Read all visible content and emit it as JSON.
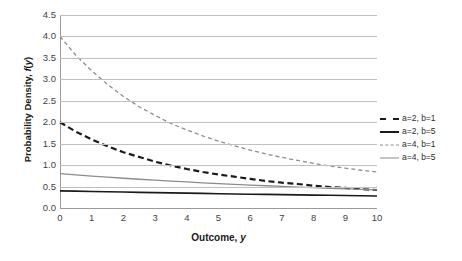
{
  "chart_data": {
    "type": "line",
    "title": "",
    "xlabel": "Outcome, y",
    "ylabel": "Probability Density, f(y)",
    "xlim": [
      0,
      10
    ],
    "ylim": [
      0,
      4.5
    ],
    "grid": true,
    "legend_position": "right",
    "x_ticks": [
      "0",
      "1",
      "2",
      "3",
      "4",
      "5",
      "6",
      "7",
      "8",
      "9",
      "10"
    ],
    "y_ticks": [
      "0.0",
      "0.5",
      "1.0",
      "1.5",
      "2.0",
      "2.5",
      "3.0",
      "3.5",
      "4.0",
      "4.5"
    ],
    "x": [
      0,
      0.5,
      1,
      1.5,
      2,
      2.5,
      3,
      3.5,
      4,
      4.5,
      5,
      5.5,
      6,
      6.5,
      7,
      7.5,
      8,
      8.5,
      9,
      9.5,
      10
    ],
    "series": [
      {
        "name": "a=2, b=1",
        "color": "#1a1a1a",
        "style": "dashed",
        "width": 2.2,
        "values": [
          2.0,
          1.78,
          1.6,
          1.44,
          1.3,
          1.19,
          1.08,
          0.99,
          0.91,
          0.84,
          0.78,
          0.73,
          0.68,
          0.63,
          0.59,
          0.56,
          0.52,
          0.49,
          0.47,
          0.44,
          0.42
        ]
      },
      {
        "name": "a=2, b=5",
        "color": "#1a1a1a",
        "style": "solid",
        "width": 1.6,
        "values": [
          0.4,
          0.393,
          0.386,
          0.379,
          0.372,
          0.365,
          0.359,
          0.352,
          0.346,
          0.34,
          0.334,
          0.328,
          0.322,
          0.317,
          0.311,
          0.306,
          0.301,
          0.296,
          0.291,
          0.286,
          0.281
        ]
      },
      {
        "name": "a=4, b=1",
        "color": "#8c8c8c",
        "style": "dashed",
        "width": 1.3,
        "values": [
          4.0,
          3.56,
          3.2,
          2.88,
          2.6,
          2.36,
          2.16,
          1.97,
          1.82,
          1.68,
          1.56,
          1.45,
          1.35,
          1.26,
          1.18,
          1.11,
          1.04,
          0.98,
          0.93,
          0.88,
          0.84
        ]
      },
      {
        "name": "a=4, b=5",
        "color": "#8c8c8c",
        "style": "solid",
        "width": 1.3,
        "values": [
          0.8,
          0.771,
          0.744,
          0.718,
          0.694,
          0.67,
          0.648,
          0.627,
          0.607,
          0.588,
          0.569,
          0.552,
          0.535,
          0.519,
          0.503,
          0.489,
          0.475,
          0.461,
          0.448,
          0.436,
          0.424
        ]
      }
    ]
  }
}
